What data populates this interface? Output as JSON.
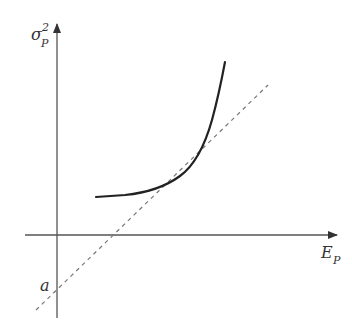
{
  "diagram": {
    "type": "mean-variance frontier with tangent line",
    "y_axis": {
      "label_base": "σ",
      "label_sup": "2",
      "label_sub": "P"
    },
    "x_axis": {
      "label_base": "E",
      "label_sub": "P"
    },
    "intercept_label": "a",
    "elements": [
      {
        "name": "frontier-curve",
        "style": "solid",
        "description": "convex variance curve rising steeply to the right"
      },
      {
        "name": "tangent-line",
        "style": "dashed",
        "description": "straight line tangent to curve, intercepting y-axis at a below origin"
      }
    ],
    "colors": {
      "axis": "#555555",
      "curve": "#222222",
      "dashed": "#777777",
      "text": "#333333"
    }
  }
}
